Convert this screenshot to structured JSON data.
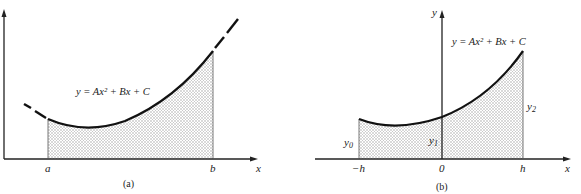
{
  "panels": [
    {
      "caption": "(a)",
      "equation": "y = Ax² + Bx + C",
      "x_axis_label": "x",
      "ticks": [
        "a",
        "b"
      ],
      "description": "Parabolic arc shaded between x=a and x=b; curve dashed outside interval"
    },
    {
      "caption": "(b)",
      "equation": "y = Ax² + Bx + C",
      "x_axis_label": "x",
      "y_axis_label": "y",
      "ticks": [
        "−h",
        "0",
        "h"
      ],
      "ordinates": [
        "y0",
        "y1",
        "y2"
      ],
      "ordinate_labels": {
        "y0": "y",
        "y0_sub": "0",
        "y1": "y",
        "y1_sub": "1",
        "y2": "y",
        "y2_sub": "2"
      },
      "description": "Parabola over [−h, h] with shaded area and ordinates y0, y1, y2"
    }
  ],
  "colors": {
    "line": "#1a1a1a",
    "shade": "#d9d9d9"
  }
}
